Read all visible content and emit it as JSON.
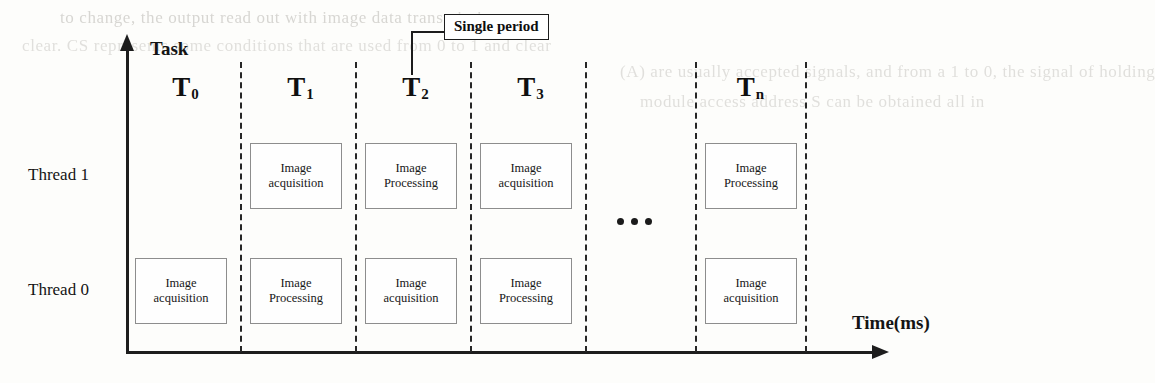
{
  "figure": {
    "axes": {
      "y_label": "Task",
      "x_label": "Time(ms)"
    },
    "callout": {
      "label": "Single period"
    },
    "ellipsis": "•••",
    "rows": [
      {
        "id": "thread1",
        "label": "Thread 1"
      },
      {
        "id": "thread0",
        "label": "Thread 0"
      }
    ],
    "periods": [
      {
        "id": "t0",
        "label": "T",
        "sub": "0"
      },
      {
        "id": "t1",
        "label": "T",
        "sub": "1"
      },
      {
        "id": "t2",
        "label": "T",
        "sub": "2"
      },
      {
        "id": "t3",
        "label": "T",
        "sub": "3"
      },
      {
        "id": "tn",
        "label": "T",
        "sub": "n"
      }
    ],
    "tasks": {
      "acquisition_line1": "Image",
      "acquisition_line2": "acquisition",
      "processing_line1": "Image",
      "processing_line2": "Processing"
    },
    "cells": [
      {
        "row": "thread1",
        "period": "t1",
        "line1": "Image",
        "line2": "acquisition"
      },
      {
        "row": "thread1",
        "period": "t2",
        "line1": "Image",
        "line2": "Processing"
      },
      {
        "row": "thread1",
        "period": "t3",
        "line1": "Image",
        "line2": "acquisition"
      },
      {
        "row": "thread1",
        "period": "tn",
        "line1": "Image",
        "line2": "Processing"
      },
      {
        "row": "thread0",
        "period": "t0",
        "line1": "Image",
        "line2": "acquisition"
      },
      {
        "row": "thread0",
        "period": "t1",
        "line1": "Image",
        "line2": "Processing"
      },
      {
        "row": "thread0",
        "period": "t2",
        "line1": "Image",
        "line2": "acquisition"
      },
      {
        "row": "thread0",
        "period": "t3",
        "line1": "Image",
        "line2": "Processing"
      },
      {
        "row": "thread0",
        "period": "tn",
        "line1": "Image",
        "line2": "acquisition"
      }
    ],
    "background_text": [
      "to change, the output read out with image data transmission",
      "clear. CS represents some conditions that are used from 0 to 1 and clear",
      "(A) are usually accepted signals, and from a 1 to 0, the signal of holding",
      "module access address S can be obtained all in"
    ]
  }
}
